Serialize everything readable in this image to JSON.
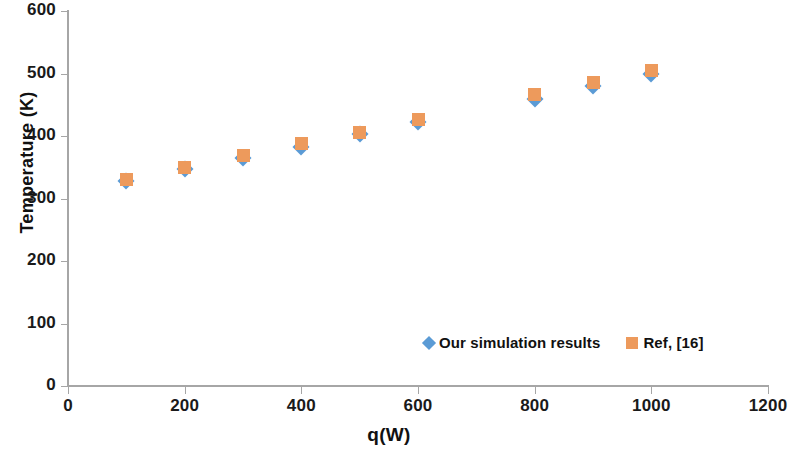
{
  "chart_data": {
    "type": "scatter",
    "title": "",
    "xlabel": "q(W)",
    "ylabel": "Temperature (K)",
    "xlim": [
      0,
      1200
    ],
    "ylim": [
      0,
      600
    ],
    "xticks": [
      0,
      200,
      400,
      600,
      800,
      1000,
      1200
    ],
    "yticks": [
      0,
      100,
      200,
      300,
      400,
      500,
      600
    ],
    "grid": false,
    "legend_position": "inside-bottom-right",
    "x": [
      100,
      200,
      300,
      400,
      500,
      600,
      800,
      900,
      1000
    ],
    "series": [
      {
        "name": "Our simulation results",
        "marker": "diamond",
        "color": "#5B9BD5",
        "values": [
          328,
          348,
          365,
          383,
          403,
          423,
          460,
          480,
          500
        ]
      },
      {
        "name": "Ref, [16]",
        "marker": "square",
        "color": "#ED9A5C",
        "values": [
          330,
          349,
          369,
          388,
          406,
          427,
          467,
          485,
          505
        ]
      }
    ]
  },
  "axes": {
    "y_title": "Temperature (K)",
    "x_title": "q(W)",
    "y_tick_labels": [
      "600",
      "500",
      "400",
      "300",
      "200",
      "100",
      "0"
    ],
    "x_tick_labels": [
      "0",
      "200",
      "400",
      "600",
      "800",
      "1000",
      "1200"
    ]
  },
  "legend": {
    "entries": [
      {
        "label": "Our simulation results",
        "color": "#5B9BD5",
        "marker": "diamond"
      },
      {
        "label": "Ref, [16]",
        "color": "#ED9A5C",
        "marker": "square"
      }
    ]
  },
  "colors": {
    "series_simulation": "#5B9BD5",
    "series_reference": "#ED9A5C",
    "axis": "#a6a6a6",
    "text": "#111111",
    "background": "#ffffff"
  }
}
